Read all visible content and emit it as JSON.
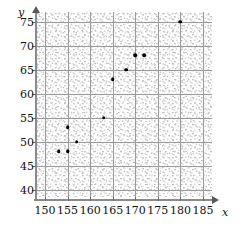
{
  "chart_data": {
    "type": "scatter",
    "title": "",
    "subtitle": "",
    "xlabel": "x",
    "ylabel": "y",
    "xlim": [
      148,
      187
    ],
    "ylim": [
      38.5,
      77
    ],
    "xticks": [
      150,
      155,
      160,
      165,
      170,
      175,
      180,
      185
    ],
    "yticks": [
      40,
      45,
      50,
      55,
      60,
      65,
      70,
      75
    ],
    "xtick_labels": [
      "150",
      "155",
      "160",
      "165",
      "170",
      "175",
      "180",
      "185"
    ],
    "ytick_labels": [
      "40",
      "45",
      "50",
      "55",
      "60",
      "65",
      "70",
      "75"
    ],
    "grid": true,
    "legend": null,
    "legend_position": "none",
    "annotations": [],
    "background": "stippled-speckle-texture",
    "points": [
      {
        "x": 153,
        "y": 48
      },
      {
        "x": 155,
        "y": 48
      },
      {
        "x": 157,
        "y": 50
      },
      {
        "x": 155,
        "y": 53
      },
      {
        "x": 163,
        "y": 55
      },
      {
        "x": 165,
        "y": 63
      },
      {
        "x": 168,
        "y": 65
      },
      {
        "x": 170,
        "y": 68
      },
      {
        "x": 172,
        "y": 68
      },
      {
        "x": 180,
        "y": 75
      }
    ],
    "x": [
      153,
      155,
      157,
      155,
      163,
      165,
      168,
      170,
      172,
      180
    ],
    "y": [
      48,
      48,
      50,
      53,
      55,
      63,
      65,
      68,
      68,
      75
    ],
    "marker": "filled-circle",
    "marker_color": "#000000",
    "n_points": 10
  },
  "colors": {
    "axis": "#6b6b6b",
    "grid": "#9a9a9a",
    "marker": "#000000",
    "text": "#111111",
    "background": "#ffffff"
  }
}
